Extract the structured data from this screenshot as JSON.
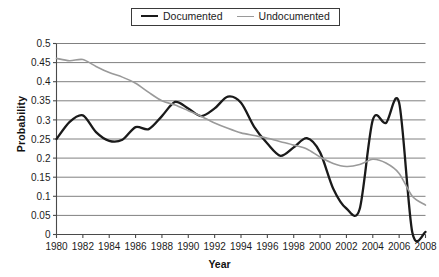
{
  "legend": {
    "position": "top-center",
    "entries": [
      {
        "label": "Documented",
        "color": "#1a1a1a",
        "icon": "line-swatch-icon"
      },
      {
        "label": "Undocumented",
        "color": "#9a9a9a",
        "icon": "line-swatch-icon"
      }
    ]
  },
  "axes": {
    "x_title": "Year",
    "y_title": "Probability",
    "x_ticks": [
      "1980",
      "1982",
      "1984",
      "1986",
      "1988",
      "1990",
      "1992",
      "1994",
      "1996",
      "1998",
      "2000",
      "2002",
      "2004",
      "2006",
      "2008"
    ],
    "y_ticks": [
      "0",
      "0.05",
      "0.1",
      "0.15",
      "0.2",
      "0.25",
      "0.3",
      "0.35",
      "0.4",
      "0.45",
      "0.5"
    ]
  },
  "colors": {
    "documented": "#1a1a1a",
    "undocumented": "#9a9a9a",
    "gridline": "#808080",
    "axis": "#4a4a4a",
    "background": "#ffffff"
  },
  "chart_data": {
    "type": "line",
    "title": "",
    "xlabel": "Year",
    "ylabel": "Probability",
    "xlim": [
      1980,
      2008
    ],
    "ylim": [
      0,
      0.5
    ],
    "ytick_step": 0.05,
    "xtick_step": 2,
    "grid": "horizontal",
    "legend_position": "top-center",
    "x": [
      1980,
      1981,
      1982,
      1983,
      1984,
      1985,
      1986,
      1987,
      1988,
      1989,
      1990,
      1991,
      1992,
      1993,
      1994,
      1995,
      1996,
      1997,
      1998,
      1999,
      2000,
      2001,
      2002,
      2003,
      2004,
      2005,
      2006,
      2007,
      2008
    ],
    "series": [
      {
        "name": "Documented",
        "color": "#1a1a1a",
        "values": [
          0.25,
          0.295,
          0.312,
          0.268,
          0.245,
          0.248,
          0.281,
          0.276,
          0.31,
          0.347,
          0.33,
          0.31,
          0.33,
          0.361,
          0.345,
          0.282,
          0.238,
          0.206,
          0.228,
          0.252,
          0.215,
          0.12,
          0.068,
          0.066,
          0.3,
          0.292,
          0.345,
          0.005,
          0.007
        ]
      },
      {
        "name": "Undocumented",
        "color": "#9a9a9a",
        "values": [
          0.461,
          0.455,
          0.458,
          0.44,
          0.424,
          0.412,
          0.396,
          0.372,
          0.35,
          0.339,
          0.324,
          0.309,
          0.292,
          0.278,
          0.266,
          0.259,
          0.252,
          0.243,
          0.234,
          0.224,
          0.203,
          0.186,
          0.178,
          0.183,
          0.197,
          0.187,
          0.16,
          0.1,
          0.077
        ]
      }
    ],
    "annotations": [
      {
        "text": "series cross near 1991 at ~0.31"
      },
      {
        "text": "Documented trough ~0.066 in 2002-2003"
      },
      {
        "text": "Documented drops to ~0.005 after 2006"
      }
    ]
  }
}
